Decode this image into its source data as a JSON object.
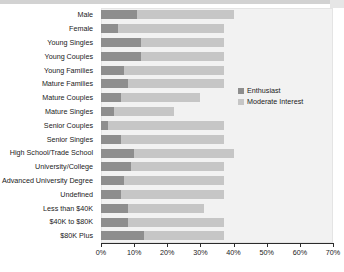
{
  "chart_data": {
    "type": "bar",
    "orientation": "horizontal",
    "stacked": true,
    "title": "",
    "xlabel": "",
    "ylabel": "",
    "xlim": [
      0,
      70
    ],
    "x_tick_labels": [
      "0%",
      "10%",
      "20%",
      "30%",
      "40%",
      "50%",
      "60%",
      "70%"
    ],
    "x_tick_values": [
      0,
      10,
      20,
      30,
      40,
      50,
      60,
      70
    ],
    "grid": false,
    "legend_position": "right-middle",
    "categories": [
      "Male",
      "Female",
      "Young Singles",
      "Young Couples",
      "Young Families",
      "Mature Families",
      "Mature Couples",
      "Mature Singles",
      "Senior Couples",
      "Senior Singles",
      "High School/Trade School",
      "University/College",
      "Advanced University Degree",
      "Undefined",
      "Less than $40K",
      "$40K to $80K",
      "$80K Plus"
    ],
    "series": [
      {
        "name": "Enthusiast",
        "color": "#8e8e8e",
        "values": [
          11,
          5,
          12,
          12,
          7,
          8,
          6,
          4,
          2,
          6,
          10,
          9,
          7,
          6,
          8,
          8,
          13
        ]
      },
      {
        "name": "Moderate Interest",
        "color": "#c6c6c6",
        "values": [
          29,
          32,
          25,
          25,
          30,
          29,
          24,
          18,
          35,
          31,
          30,
          28,
          30,
          31,
          23,
          29,
          24
        ]
      }
    ],
    "cumulative_totals": [
      40,
      37,
      37,
      37,
      37,
      37,
      30,
      22,
      37,
      37,
      40,
      37,
      37,
      37,
      31,
      37,
      37
    ]
  },
  "legend": {
    "items": [
      {
        "label": "Enthusiast",
        "color": "#8e8e8e"
      },
      {
        "label": "Moderate Interest",
        "color": "#c6c6c6"
      }
    ]
  },
  "colors": {
    "enthusiast": "#8e8e8e",
    "moderate_interest": "#c6c6c6",
    "plot_background": "#f2f2f2",
    "axis": "#2b2b2b",
    "text": "#1a1a1a"
  }
}
